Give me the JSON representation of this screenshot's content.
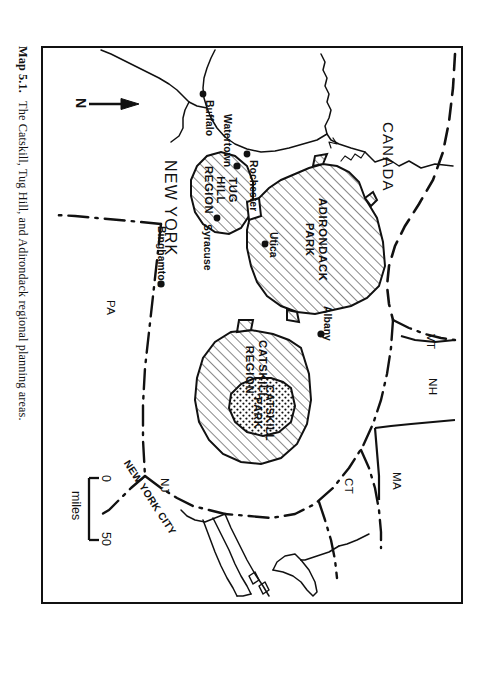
{
  "figure": {
    "caption_number": "Map 5.1.",
    "caption_text": "The Catskill, Tug Hill, and Adirondack regional planning areas.",
    "ink_color": "#111111",
    "background_color": "#ffffff"
  },
  "map": {
    "title_area": "New York State regional planning areas",
    "north_arrow_label": "N",
    "scale_bar": {
      "min_label": "0",
      "max_label": "50",
      "unit_label": "miles"
    },
    "country_labels": [
      {
        "name": "CANADA"
      }
    ],
    "state_labels": [
      {
        "name": "NEW YORK"
      },
      {
        "name": "VT"
      },
      {
        "name": "NH"
      },
      {
        "name": "MA"
      },
      {
        "name": "CT"
      },
      {
        "name": "NJ"
      },
      {
        "name": "PA"
      }
    ],
    "place_labels": [
      {
        "name": "NEW YORK CITY"
      }
    ],
    "cities": [
      {
        "name": "Buffalo"
      },
      {
        "name": "Rochester"
      },
      {
        "name": "Syracuse"
      },
      {
        "name": "Watertown"
      },
      {
        "name": "Utica"
      },
      {
        "name": "Albany"
      },
      {
        "name": "Binghamton"
      }
    ],
    "planning_areas": [
      {
        "name_line1": "ADIRONDACK",
        "name_line2": "PARK",
        "fill": "diagonal-hatch"
      },
      {
        "name_line1": "TUG",
        "name_line2": "HILL",
        "name_line3": "REGION",
        "fill": "diagonal-hatch"
      },
      {
        "name_line1": "CATSKILL",
        "name_line2": "REGION",
        "fill": "diagonal-hatch"
      },
      {
        "name_line1": "CATSKILL",
        "name_line2": "PARK",
        "fill": "stipple-dots"
      }
    ],
    "legend_note": "Hatched areas are regional planning areas; stippled area is Catskill Park."
  }
}
